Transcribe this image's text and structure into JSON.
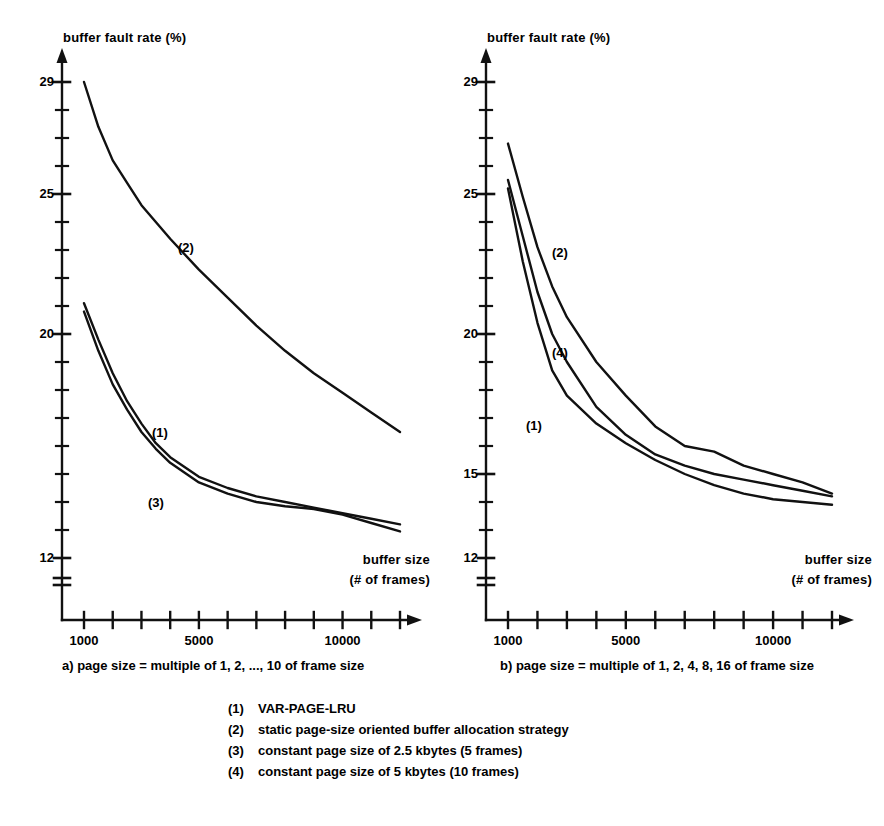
{
  "figure": {
    "panels": [
      {
        "id": "a",
        "caption": "a) page size = multiple of 1, 2, ..., 10 of frame size",
        "y_axis_title": "buffer fault rate (%)",
        "x_axis_title_line1": "buffer size",
        "x_axis_title_line2": "(# of frames)",
        "y_tick_labels": [
          "29",
          "25",
          "20",
          "12"
        ],
        "x_tick_labels": [
          "1000",
          "5000",
          "10000"
        ],
        "curve_labels": [
          "(2)",
          "(1)",
          "(3)"
        ]
      },
      {
        "id": "b",
        "caption": "b) page size = multiple of 1, 2, 4, 8, 16 of frame size",
        "y_axis_title": "buffer fault rate (%)",
        "x_axis_title_line1": "buffer size",
        "x_axis_title_line2": "(# of frames)",
        "y_tick_labels": [
          "29",
          "25",
          "20",
          "15",
          "12"
        ],
        "x_tick_labels": [
          "1000",
          "5000",
          "10000"
        ],
        "curve_labels": [
          "(2)",
          "(4)",
          "(1)"
        ]
      }
    ],
    "legend": [
      {
        "key": "(1)",
        "text": "VAR-PAGE-LRU"
      },
      {
        "key": "(2)",
        "text": "static page-size oriented buffer allocation strategy"
      },
      {
        "key": "(3)",
        "text": "constant page size of 2.5 kbytes (5 frames)"
      },
      {
        "key": "(4)",
        "text": "constant page size of 5 kbytes (10 frames)"
      }
    ],
    "line_color": "#111111"
  },
  "chart_data": [
    {
      "type": "line",
      "title": "a) page size = multiple of 1, 2, ..., 10 of frame size",
      "xlabel": "buffer size (# of frames)",
      "ylabel": "buffer fault rate (%)",
      "xlim": [
        1000,
        12000
      ],
      "ylim": [
        11.5,
        29.5
      ],
      "x_ticks": [
        1000,
        2000,
        3000,
        4000,
        5000,
        6000,
        7000,
        8000,
        9000,
        10000,
        11000,
        12000
      ],
      "x_tick_labels": [
        "1000",
        "",
        "",
        "",
        "5000",
        "",
        "",
        "",
        "",
        "10000",
        "",
        ""
      ],
      "y_ticks": [
        12,
        13,
        14,
        15,
        16,
        17,
        18,
        19,
        20,
        21,
        22,
        23,
        24,
        25,
        26,
        27,
        28,
        29
      ],
      "y_tick_labels": [
        "12",
        "",
        "",
        "",
        "",
        "",
        "",
        "",
        "20",
        "",
        "",
        "",
        "",
        "25",
        "",
        "",
        "",
        "29"
      ],
      "y_axis_break": true,
      "grid": false,
      "legend_position": "inline-labels",
      "series": [
        {
          "name": "(2) static page-size oriented buffer allocation strategy",
          "x": [
            1000,
            1500,
            2000,
            2500,
            3000,
            3500,
            4000,
            5000,
            6000,
            7000,
            8000,
            9000,
            10000,
            11000,
            12000
          ],
          "y": [
            29.0,
            27.4,
            26.2,
            25.4,
            24.6,
            24.0,
            23.4,
            22.3,
            21.3,
            20.3,
            19.4,
            18.6,
            17.9,
            17.2,
            16.5
          ]
        },
        {
          "name": "(1) VAR-PAGE-LRU",
          "x": [
            1000,
            1500,
            2000,
            2500,
            3000,
            3500,
            4000,
            5000,
            6000,
            7000,
            8000,
            9000,
            10000,
            11000,
            12000
          ],
          "y": [
            21.1,
            19.8,
            18.6,
            17.6,
            16.8,
            16.1,
            15.6,
            14.9,
            14.5,
            14.2,
            14.0,
            13.8,
            13.6,
            13.4,
            13.2
          ]
        },
        {
          "name": "(3) constant page size of 2.5 kbytes (5 frames)",
          "x": [
            1000,
            1500,
            2000,
            2500,
            3000,
            3500,
            4000,
            5000,
            6000,
            7000,
            8000,
            9000,
            10000,
            11000,
            12000
          ],
          "y": [
            20.8,
            19.4,
            18.2,
            17.3,
            16.5,
            15.9,
            15.4,
            14.7,
            14.3,
            14.0,
            13.85,
            13.75,
            13.55,
            13.25,
            12.95
          ]
        }
      ]
    },
    {
      "type": "line",
      "title": "b) page size = multiple of 1, 2, 4, 8, 16 of frame size",
      "xlabel": "buffer size (# of frames)",
      "ylabel": "buffer fault rate (%)",
      "xlim": [
        1000,
        12000
      ],
      "ylim": [
        11.5,
        29.5
      ],
      "x_ticks": [
        1000,
        2000,
        3000,
        4000,
        5000,
        6000,
        7000,
        8000,
        9000,
        10000,
        11000,
        12000
      ],
      "x_tick_labels": [
        "1000",
        "",
        "",
        "",
        "5000",
        "",
        "",
        "",
        "",
        "10000",
        "",
        ""
      ],
      "y_ticks": [
        12,
        13,
        14,
        15,
        16,
        17,
        18,
        19,
        20,
        21,
        22,
        23,
        24,
        25,
        26,
        27,
        28,
        29
      ],
      "y_tick_labels": [
        "12",
        "",
        "",
        "15",
        "",
        "",
        "",
        "",
        "20",
        "",
        "",
        "",
        "",
        "25",
        "",
        "",
        "",
        "29"
      ],
      "y_axis_break": true,
      "grid": false,
      "legend_position": "inline-labels",
      "series": [
        {
          "name": "(2) static page-size oriented buffer allocation strategy",
          "x": [
            1000,
            1500,
            2000,
            2500,
            3000,
            4000,
            5000,
            6000,
            7000,
            8000,
            9000,
            10000,
            11000,
            12000
          ],
          "y": [
            26.8,
            24.9,
            23.1,
            21.7,
            20.6,
            19.0,
            17.8,
            16.7,
            16.0,
            15.8,
            15.3,
            15.0,
            14.7,
            14.3
          ]
        },
        {
          "name": "(4) constant page size of 5 kbytes (10 frames)",
          "x": [
            1000,
            1500,
            2000,
            2500,
            3000,
            4000,
            5000,
            6000,
            7000,
            8000,
            9000,
            10000,
            11000,
            12000
          ],
          "y": [
            25.5,
            23.5,
            21.5,
            20.0,
            19.0,
            17.4,
            16.4,
            15.7,
            15.3,
            15.0,
            14.8,
            14.6,
            14.4,
            14.2
          ]
        },
        {
          "name": "(1) VAR-PAGE-LRU",
          "x": [
            1000,
            1500,
            2000,
            2500,
            3000,
            4000,
            5000,
            6000,
            7000,
            8000,
            9000,
            10000,
            11000,
            12000
          ],
          "y": [
            25.2,
            22.6,
            20.4,
            18.7,
            17.8,
            16.8,
            16.1,
            15.5,
            15.0,
            14.6,
            14.3,
            14.1,
            14.0,
            13.9
          ]
        }
      ]
    }
  ]
}
